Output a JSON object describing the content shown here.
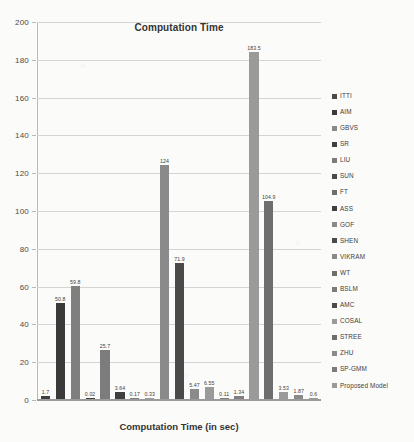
{
  "chart_data": {
    "type": "bar",
    "title": "Computation Time",
    "xlabel": "Computation Time (in sec)",
    "ylabel": "",
    "ylim": [
      0,
      200
    ],
    "yticks": [
      0,
      20,
      40,
      60,
      80,
      100,
      120,
      140,
      160,
      180,
      200
    ],
    "grid": true,
    "legend_position": "right",
    "categories": [
      "ITTI",
      "AIM",
      "GBVS",
      "SR",
      "LIU",
      "SUN",
      "FT",
      "ASS",
      "GOF",
      "SHEN",
      "VIKRAM",
      "WT",
      "BSLM",
      "AMC",
      "COSAL",
      "STREE",
      "ZHU",
      "SP-GMM",
      "Proposed Model"
    ],
    "values": [
      1.7,
      50.8,
      59.8,
      0.02,
      25.7,
      3.64,
      0.17,
      0.33,
      124,
      71.9,
      5.47,
      6.55,
      0.11,
      1.34,
      183.5,
      104.9,
      3.53,
      1.87,
      0.6
    ],
    "value_labels": [
      "1.7",
      "50.8",
      "59.8",
      "0.02",
      "25.7",
      "3.64",
      "0.17",
      "0.33",
      "124",
      "71.9",
      "5.47",
      "6.55",
      "0.11",
      "1.34",
      "183.5",
      "104.9",
      "3.53",
      "1.87",
      "0.6"
    ],
    "series": [
      {
        "name": "Computation Time",
        "values": [
          1.7,
          50.8,
          59.8,
          0.02,
          25.7,
          3.64,
          0.17,
          0.33,
          124,
          71.9,
          5.47,
          6.55,
          0.11,
          1.34,
          183.5,
          104.9,
          3.53,
          1.87,
          0.6
        ]
      }
    ],
    "bar_colors": [
      "#3f3f3f",
      "#3a3a3a",
      "#7f7f7f",
      "#3f3f3f",
      "#7c7c7c",
      "#3f3f3f",
      "#7f7f7f",
      "#9a9a9a",
      "#8a8a8a",
      "#4a4a4a",
      "#8a8a8a",
      "#9a9a9a",
      "#7f7f7f",
      "#7f7f7f",
      "#9a9a9a",
      "#6e6e6e",
      "#9a9a9a",
      "#8a8a8a",
      "#9a9a9a"
    ]
  },
  "legend": {
    "items": [
      {
        "label": "ITTI",
        "color": "#4a4a4a"
      },
      {
        "label": "AIM",
        "color": "#3a3a3a"
      },
      {
        "label": "GBVS",
        "color": "#8a8a8a"
      },
      {
        "label": "SR",
        "color": "#3f3f3f"
      },
      {
        "label": "LIU",
        "color": "#7c7c7c"
      },
      {
        "label": "SUN",
        "color": "#4a4a4a"
      },
      {
        "label": "FT",
        "color": "#6e6e6e"
      },
      {
        "label": "ASS",
        "color": "#3f3f3f"
      },
      {
        "label": "GOF",
        "color": "#8a8a8a"
      },
      {
        "label": "SHEN",
        "color": "#4a4a4a"
      },
      {
        "label": "VIKRAM",
        "color": "#8a8a8a"
      },
      {
        "label": "WT",
        "color": "#6e6e6e"
      },
      {
        "label": "BSLM",
        "color": "#7c7c7c"
      },
      {
        "label": "AMC",
        "color": "#4a4a4a"
      },
      {
        "label": "COSAL",
        "color": "#9a9a9a"
      },
      {
        "label": "STREE",
        "color": "#6e6e6e"
      },
      {
        "label": "ZHU",
        "color": "#8a8a8a"
      },
      {
        "label": "SP-GMM",
        "color": "#7c7c7c"
      },
      {
        "label": "Proposed Model",
        "color": "#9a9a9a"
      }
    ]
  },
  "axis": {
    "y_tick_labels": [
      "200",
      "180",
      "160",
      "140",
      "120",
      "100",
      "80",
      "60",
      "40",
      "20",
      "0"
    ]
  }
}
